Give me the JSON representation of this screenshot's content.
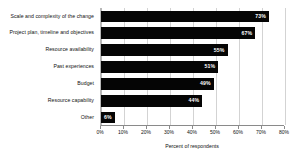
{
  "chart_data": {
    "type": "bar",
    "orientation": "horizontal",
    "title": "",
    "xlabel": "Percent of respondents",
    "ylabel": "",
    "categories": [
      "Scale and complexity of the change",
      "Project plan, timeline and objectives",
      "Resource availability",
      "Past experiences",
      "Budget",
      "Resource capability",
      "Other"
    ],
    "values": [
      73,
      67,
      55,
      51,
      49,
      44,
      6
    ],
    "value_labels": [
      "73%",
      "67%",
      "55%",
      "51%",
      "49%",
      "44%",
      "6%"
    ],
    "xlim": [
      0,
      80
    ],
    "xticks": [
      0,
      10,
      20,
      30,
      40,
      50,
      60,
      70,
      80
    ],
    "xtick_labels": [
      "0%",
      "10%",
      "20%",
      "30%",
      "40%",
      "50%",
      "60%",
      "70%",
      "80%"
    ],
    "grid": true,
    "grid_axis": "x",
    "legend": false,
    "bar_color": "#050505",
    "value_label_color": "#ffffff",
    "gridline_color": "#d3d3d3",
    "axis_color": "#8a8a8a",
    "background_color": "#ffffff"
  }
}
